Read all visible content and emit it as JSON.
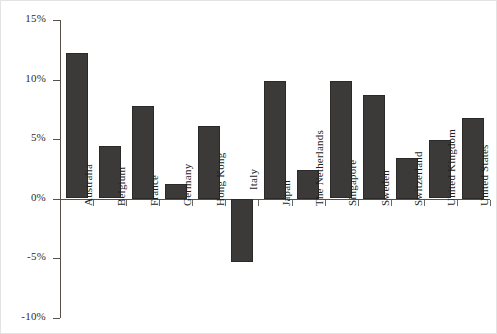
{
  "chart_data": {
    "type": "bar",
    "title": "",
    "subtitle": "",
    "xlabel": "",
    "ylabel": "",
    "categories": [
      "Australia",
      "Belgium",
      "France",
      "Germany",
      "Hong Kong",
      "Italy",
      "Japan",
      "The Netherlands",
      "Singapore",
      "Sweden",
      "Switzerland",
      "United Kingdom",
      "United States"
    ],
    "values": [
      12.2,
      4.4,
      7.8,
      1.25,
      6.1,
      -5.3,
      9.9,
      2.4,
      9.85,
      8.7,
      3.4,
      4.9,
      6.8
    ],
    "ylim": [
      -10,
      15
    ],
    "ytick_values": [
      15,
      10,
      5,
      0,
      -5,
      -10
    ],
    "ytick_labels": [
      "15%",
      "10%",
      "5%",
      "0%",
      "-5%",
      "-10%"
    ],
    "grid": false,
    "legend": null,
    "legend_position": "none",
    "series": [
      {
        "name": "",
        "values": [
          12.2,
          4.4,
          7.8,
          1.25,
          6.1,
          -5.3,
          9.9,
          2.4,
          9.85,
          8.7,
          3.4,
          4.9,
          6.8
        ]
      }
    ],
    "bar_color": "#3c3a39",
    "axis_color": "#55504c",
    "background_color": "#ffffff"
  }
}
